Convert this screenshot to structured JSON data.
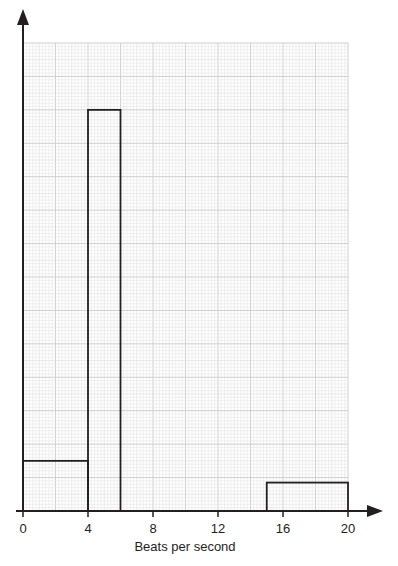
{
  "chart_data": {
    "type": "bar",
    "subtype": "histogram",
    "title": "",
    "xlabel": "Beats per second",
    "ylabel": "",
    "xlim": [
      0,
      20
    ],
    "x_ticks": [
      0,
      4,
      8,
      12,
      16,
      20
    ],
    "x_tick_labels": [
      "0",
      "4",
      "8",
      "12",
      "16",
      "20"
    ],
    "y_ticks": [],
    "grid": true,
    "y_units": "small grid squares (no y-axis scale shown)",
    "ylim": [
      0,
      140
    ],
    "bins": [
      {
        "x_start": 0,
        "x_end": 4,
        "height": 15
      },
      {
        "x_start": 4,
        "x_end": 6,
        "height": 120
      },
      {
        "x_start": 15,
        "x_end": 20,
        "height": 8.5
      }
    ],
    "categories": [
      "0-4",
      "4-6",
      "15-20"
    ],
    "values": [
      15,
      120,
      8.5
    ]
  },
  "colors": {
    "axis": "#231f20",
    "bar_stroke": "#231f20",
    "grid_minor": "#e6e6e6",
    "grid_major": "#cfcfcf"
  }
}
